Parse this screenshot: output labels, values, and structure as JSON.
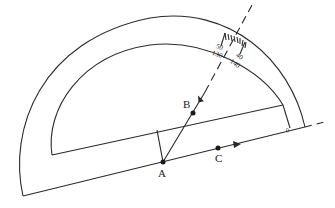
{
  "diagram": {
    "points": [
      {
        "name": "A",
        "label": "A"
      },
      {
        "name": "B",
        "label": "B"
      },
      {
        "name": "C",
        "label": "C"
      }
    ],
    "scale": {
      "outer_labels": [
        "50",
        "40"
      ],
      "inner_labels": [
        "130",
        "140"
      ],
      "zero_mark": "0"
    },
    "colors": {
      "stroke": "#2a2a2a",
      "background": "#ffffff"
    }
  }
}
